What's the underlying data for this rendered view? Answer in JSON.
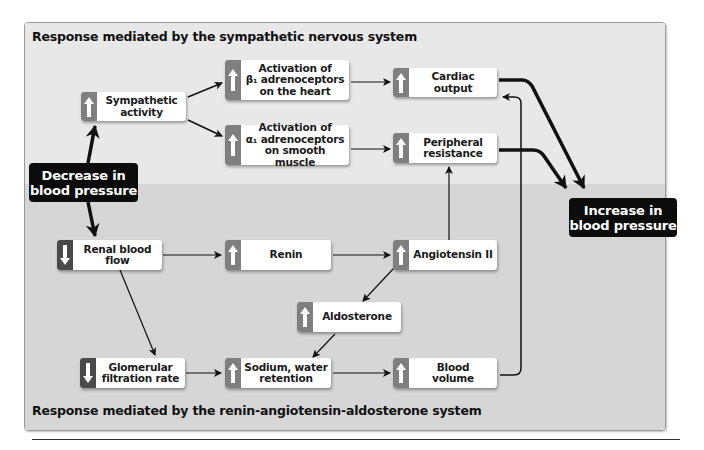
{
  "titles": {
    "top": "Response mediated by the sympathetic nervous system",
    "bottom": "Response mediated by the renin-angiotensin-aldosterone system"
  },
  "colors": {
    "top_region": "#e8e8e8",
    "bottom_region": "#d6d6d6",
    "tab_up": "#7f7f7f",
    "tab_down": "#4a4a4a",
    "bp_box": "#0c0c0c"
  },
  "start": {
    "label": "Decrease in\nblood pressure"
  },
  "end": {
    "label": "Increase in\nblood pressure"
  },
  "nodes": {
    "sympathetic_activity": {
      "label": "Sympathetic\nactivity",
      "direction": "up"
    },
    "beta1": {
      "label": "Activation of\nβ₁ adrenoceptors\non the  heart",
      "direction": "up"
    },
    "alpha1": {
      "label": "Activation of\nα₁ adrenoceptors\non smooth muscle",
      "direction": "up"
    },
    "cardiac_output": {
      "label": "Cardiac\noutput",
      "direction": "up"
    },
    "peripheral_resistance": {
      "label": "Peripheral\nresistance",
      "direction": "up"
    },
    "renal_blood_flow": {
      "label": "Renal blood\nflow",
      "direction": "down"
    },
    "renin": {
      "label": "Renin",
      "direction": "up"
    },
    "angiotensin_ii": {
      "label": "Angiotensin II",
      "direction": "up"
    },
    "aldosterone": {
      "label": "Aldosterone",
      "direction": "up"
    },
    "gfr": {
      "label": "Glomerular\nfiltration rate",
      "direction": "down"
    },
    "sodium_water": {
      "label": "Sodium, water\nretention",
      "direction": "up"
    },
    "blood_volume": {
      "label": "Blood\nvolume",
      "direction": "up"
    }
  },
  "icons": {
    "up": "arrow-up-icon",
    "down": "arrow-down-icon"
  }
}
